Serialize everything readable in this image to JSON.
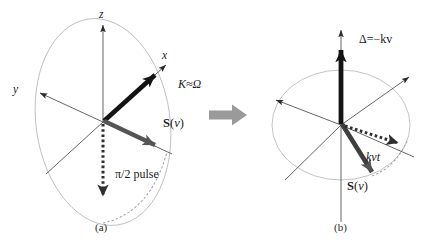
{
  "figure": {
    "background_color": "#ffffff",
    "width": 444,
    "height": 249
  },
  "colors": {
    "ink": "#1b1b1b",
    "thin_line": "#4a4a4a",
    "ellipse": "#b9b9b9",
    "gray_arrow": "#555555",
    "transition_arrow": "#9a9a9a",
    "dotted": "#3a3a3a",
    "dashed_arc": "#a8a8a8"
  },
  "panel_a": {
    "caption": "(a)",
    "axis_labels": {
      "x": "x",
      "y": "y",
      "z": "z"
    },
    "annotations": {
      "coupling": "K≈Ω",
      "pulse": "π/2 pulse"
    },
    "spin_vector": {
      "bold_symbol": "S",
      "open_paren": "(",
      "argument": "v",
      "close_paren": ")"
    },
    "ellipse": {
      "center_x": 103,
      "center_y": 122,
      "radius_x": 67,
      "radius_y": 104,
      "rotation_deg": -8
    },
    "vectors": [
      {
        "name": "K-vector",
        "style": "thick-black",
        "angle_note": "up-right toward x axis"
      },
      {
        "name": "S-vector",
        "style": "thick-gray",
        "angle_note": "right and slightly down"
      },
      {
        "name": "dotted-z-down",
        "style": "dotted-black",
        "angle_note": "straight down"
      }
    ]
  },
  "panel_b": {
    "caption": "(b)",
    "annotations": {
      "detuning": "Δ=−kv",
      "phase": "kvt"
    },
    "spin_vector": {
      "bold_symbol": "S",
      "open_paren": "(",
      "argument": "v",
      "close_paren": ")"
    },
    "ellipse": {
      "center_x": 341,
      "center_y": 125,
      "radius_x": 69,
      "radius_y": 55,
      "rotation_deg": 0
    },
    "vectors": [
      {
        "name": "delta-vector",
        "style": "thick-black",
        "angle_note": "straight up"
      },
      {
        "name": "S-vector",
        "style": "thick-gray",
        "angle_note": "down-right"
      },
      {
        "name": "dotted-in-plane",
        "style": "dotted-black",
        "angle_note": "right and slightly down"
      }
    ]
  },
  "transition": {
    "icon": "right-block-arrow"
  }
}
